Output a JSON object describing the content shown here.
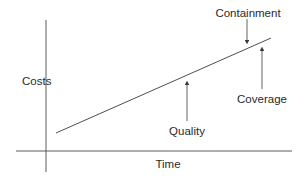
{
  "diagram": {
    "y_axis_label": "Costs",
    "x_axis_label": "Time",
    "annotations": [
      {
        "label": "Containment",
        "direction": "down"
      },
      {
        "label": "Coverage",
        "direction": "up"
      },
      {
        "label": "Quality",
        "direction": "up"
      }
    ],
    "colors": {
      "line": "#3a3a3a",
      "text": "#2a2a2a",
      "background": "#ffffff"
    }
  }
}
